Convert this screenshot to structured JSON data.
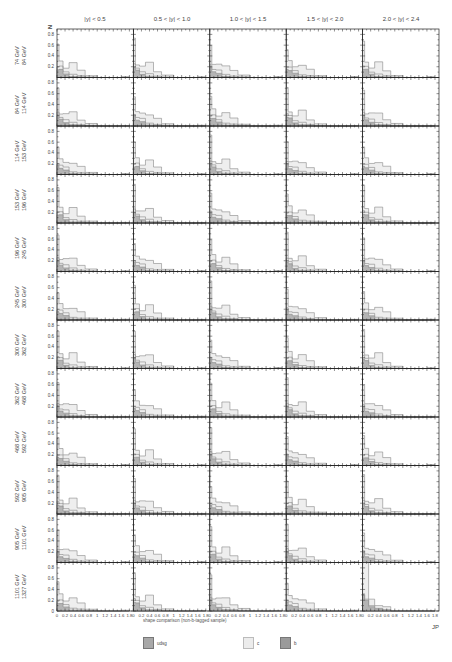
{
  "figure": {
    "top_label": "",
    "y_axis_label": "N",
    "x_axis_label": "JP",
    "x_title": "shape comparison (non-b-tagged sample)"
  },
  "columns": [
    "|y| < 0.5",
    "0.5 < |y| < 1.0",
    "1.0 < |y| < 1.5",
    "1.5 < |y| < 2.0",
    "2.0 < |y| < 2.4"
  ],
  "rows": [
    {
      "lo": "74 GeV",
      "hi": "84 GeV"
    },
    {
      "lo": "84 GeV",
      "hi": "114 GeV"
    },
    {
      "lo": "114 GeV",
      "hi": "153 GeV"
    },
    {
      "lo": "153 GeV",
      "hi": "196 GeV"
    },
    {
      "lo": "196 GeV",
      "hi": "245 GeV"
    },
    {
      "lo": "245 GeV",
      "hi": "300 GeV"
    },
    {
      "lo": "300 GeV",
      "hi": "362 GeV"
    },
    {
      "lo": "362 GeV",
      "hi": "468 GeV"
    },
    {
      "lo": "468 GeV",
      "hi": "592 GeV"
    },
    {
      "lo": "592 GeV",
      "hi": "905 GeV"
    },
    {
      "lo": "905 GeV",
      "hi": "1101 GeV"
    },
    {
      "lo": "1101 GeV",
      "hi": "1327 GeV"
    }
  ],
  "legend": [
    {
      "label": "udsg",
      "color": "#a8a8a8"
    },
    {
      "label": "c",
      "color": "#ececec"
    },
    {
      "label": "b",
      "color": "#9a9a9a"
    }
  ],
  "colors": {
    "udsg_fill": "#b4b4b4",
    "c_fill": "#eeeeee",
    "outline": "#888888",
    "axis": "#222222"
  },
  "chart_data": {
    "type": "bar",
    "title": "",
    "xlabel": "JP",
    "ylabel": "N",
    "xlim": [
      0,
      1.9
    ],
    "ylim": [
      0,
      0.9
    ],
    "x_ticks": [
      "0",
      "0.2",
      "0.4",
      "0.6",
      "0.8",
      "1",
      "1.2",
      "1.4",
      "1.6",
      "1.8"
    ],
    "y_ticks": [
      "0",
      "0.2",
      "0.4",
      "0.6",
      "0.8"
    ],
    "grid": false,
    "legend_position": "bottom",
    "bin_edges": [
      0,
      0.05,
      0.15,
      0.3,
      0.5,
      0.7,
      1.0,
      1.6,
      1.8
    ],
    "series_names": [
      "udsg",
      "c",
      "b"
    ],
    "panels_note": "rows: pT bins (12), columns: |y| bins (5); values are normalized fractions per bin",
    "typical_panel": {
      "udsg": [
        0.17,
        0.13,
        0.07,
        0.02,
        0.01,
        0.0,
        0.0,
        0.01
      ],
      "c": [
        0.62,
        0.27,
        0.21,
        0.25,
        0.13,
        0.04,
        0.0,
        0.01
      ],
      "b": [
        0.22,
        0.18,
        0.12,
        0.06,
        0.03,
        0.01,
        0.0,
        0.0
      ]
    },
    "special_panel": {
      "row": "1101-1327 GeV",
      "column": "2.0 < |y| < 2.4",
      "udsg": [
        0.3,
        0.2,
        0.08,
        0.04,
        0.02,
        0.0,
        0.0,
        0.0
      ],
      "c": [
        0.9,
        0.9,
        0.22,
        0.1,
        0.08,
        0.0,
        0.0,
        0.0
      ],
      "b": [
        0.32,
        0.22,
        0.1,
        0.05,
        0.02,
        0.0,
        0.0,
        0.0
      ]
    }
  }
}
